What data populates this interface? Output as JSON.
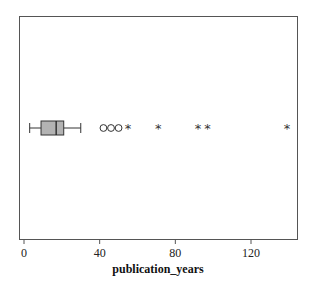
{
  "chart_data": {
    "type": "boxplot",
    "orientation": "horizontal",
    "title": "",
    "xlabel": "publication_years",
    "ylabel": "",
    "xlim": [
      -3,
      143
    ],
    "xticks": [
      0,
      40,
      80,
      120
    ],
    "xtick_labels": [
      "0",
      "40",
      "80",
      "120"
    ],
    "grid": false,
    "legend": null,
    "box": {
      "whisker_low": 3,
      "q1": 9,
      "median": 17,
      "q3": 21,
      "whisker_high": 30,
      "fill": "#b3b3b3"
    },
    "outliers_mild": [
      42,
      46,
      50
    ],
    "outliers_extreme": [
      55,
      71,
      92,
      97,
      139
    ]
  },
  "colors": {
    "frame": "#555555",
    "box_fill": "#b3b3b3",
    "stroke": "#333333"
  }
}
